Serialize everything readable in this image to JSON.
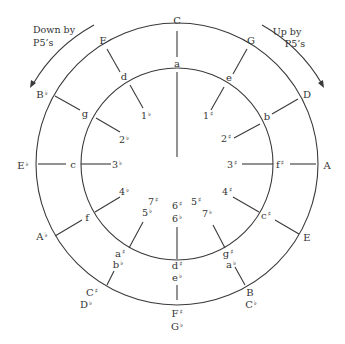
{
  "diagram": {
    "colors": {
      "line": "#3a3a3a",
      "text": "#333333",
      "background": "#ffffff"
    },
    "geometry": {
      "cx": 177,
      "cy": 164,
      "outer_r": 141,
      "inner_r": 96
    },
    "captions": {
      "left": {
        "line1": "Down by",
        "line2": "P5’s",
        "direction": "counterclockwise"
      },
      "right": {
        "line1": "Up by",
        "line2": "P5’s",
        "direction": "clockwise"
      }
    },
    "positions": [
      {
        "angle": 0,
        "major": [
          "C"
        ],
        "minor": [
          "a"
        ],
        "signature": [
          "0"
        ]
      },
      {
        "angle": 30,
        "major": [
          "G"
        ],
        "minor": [
          "e"
        ],
        "signature": [
          "1♯"
        ]
      },
      {
        "angle": 60,
        "major": [
          "D"
        ],
        "minor": [
          "b"
        ],
        "signature": [
          "2♯"
        ]
      },
      {
        "angle": 90,
        "major": [
          "A"
        ],
        "minor": [
          "f♯"
        ],
        "signature": [
          "3♯"
        ]
      },
      {
        "angle": 120,
        "major": [
          "E"
        ],
        "minor": [
          "c♯"
        ],
        "signature": [
          "4♯"
        ]
      },
      {
        "angle": 150,
        "major": [
          "B",
          "C♭"
        ],
        "minor": [
          "g♯",
          "a♭"
        ],
        "signature": [
          "5♯",
          "7♭"
        ]
      },
      {
        "angle": 180,
        "major": [
          "F♯",
          "G♭"
        ],
        "minor": [
          "d♯",
          "e♭"
        ],
        "signature": [
          "6♯",
          "6♭"
        ]
      },
      {
        "angle": 210,
        "major": [
          "C♯",
          "D♭"
        ],
        "minor": [
          "a♯",
          "b♭"
        ],
        "signature": [
          "7♯",
          "5♭"
        ]
      },
      {
        "angle": 240,
        "major": [
          "A♭"
        ],
        "minor": [
          "f"
        ],
        "signature": [
          "4♭"
        ]
      },
      {
        "angle": 270,
        "major": [
          "E♭"
        ],
        "minor": [
          "c"
        ],
        "signature": [
          "3♭"
        ]
      },
      {
        "angle": 300,
        "major": [
          "B♭"
        ],
        "minor": [
          "g"
        ],
        "signature": [
          "2♭"
        ]
      },
      {
        "angle": 330,
        "major": [
          "F"
        ],
        "minor": [
          "d"
        ],
        "signature": [
          "1♭"
        ]
      }
    ],
    "labels": {
      "major": {
        "C": {
          "text": "C",
          "acc": "",
          "x": 177,
          "y": 24
        },
        "G": {
          "text": "G",
          "acc": "",
          "x": 251,
          "y": 44
        },
        "D": {
          "text": "D",
          "acc": "",
          "x": 307,
          "y": 98
        },
        "A": {
          "text": "A",
          "acc": "",
          "x": 327,
          "y": 169
        },
        "E": {
          "text": "E",
          "acc": "",
          "x": 307,
          "y": 241
        },
        "B": {
          "text": "B",
          "acc": "",
          "x": 250,
          "y": 296
        },
        "Cb": {
          "text": "C",
          "acc": "♭",
          "x": 251,
          "y": 308
        },
        "Fs": {
          "text": "F",
          "acc": "♯",
          "x": 177,
          "y": 317
        },
        "Gb": {
          "text": "G",
          "acc": "♭",
          "x": 177,
          "y": 330
        },
        "Cs": {
          "text": "C",
          "acc": "♯",
          "x": 92,
          "y": 296
        },
        "Db": {
          "text": "D",
          "acc": "♭",
          "x": 86,
          "y": 308
        },
        "Ab": {
          "text": "A",
          "acc": "♭",
          "x": 42,
          "y": 240
        },
        "Eb": {
          "text": "E",
          "acc": "♭",
          "x": 23,
          "y": 169
        },
        "Bb": {
          "text": "B",
          "acc": "♭",
          "x": 42,
          "y": 98
        },
        "F": {
          "text": "F",
          "acc": "",
          "x": 103,
          "y": 44
        }
      },
      "minor": {
        "a": {
          "text": "a",
          "acc": "",
          "x": 177,
          "y": 67
        },
        "e": {
          "text": "e",
          "acc": "",
          "x": 229,
          "y": 81
        },
        "b": {
          "text": "b",
          "acc": "",
          "x": 267,
          "y": 120
        },
        "fs": {
          "text": "f",
          "acc": "♯",
          "x": 280,
          "y": 168
        },
        "cs": {
          "text": "c",
          "acc": "♯",
          "x": 266,
          "y": 219
        },
        "gs": {
          "text": "g",
          "acc": "♯",
          "x": 228,
          "y": 257
        },
        "ab": {
          "text": "a",
          "acc": "♭",
          "x": 231,
          "y": 268
        },
        "ds": {
          "text": "d",
          "acc": "♯",
          "x": 177,
          "y": 269
        },
        "eb": {
          "text": "e",
          "acc": "♭",
          "x": 177,
          "y": 281
        },
        "as": {
          "text": "a",
          "acc": "♯",
          "x": 120,
          "y": 257
        },
        "bb": {
          "text": "b",
          "acc": "♭",
          "x": 118,
          "y": 268
        },
        "f": {
          "text": "f",
          "acc": "",
          "x": 87,
          "y": 221
        },
        "c": {
          "text": "c",
          "acc": "",
          "x": 73,
          "y": 168
        },
        "g": {
          "text": "g",
          "acc": "",
          "x": 85,
          "y": 117
        },
        "d": {
          "text": "d",
          "acc": "",
          "x": 124,
          "y": 80
        }
      },
      "signature": {
        "1s": {
          "text": "1",
          "acc": "♯",
          "x": 208,
          "y": 119
        },
        "2s": {
          "text": "2",
          "acc": "♯",
          "x": 226,
          "y": 142
        },
        "3s": {
          "text": "3",
          "acc": "♯",
          "x": 232,
          "y": 168
        },
        "4s": {
          "text": "4",
          "acc": "♯",
          "x": 227,
          "y": 195
        },
        "5s": {
          "text": "5",
          "acc": "♯",
          "x": 196,
          "y": 205
        },
        "7b": {
          "text": "7",
          "acc": "♭",
          "x": 207,
          "y": 217
        },
        "6s": {
          "text": "6",
          "acc": "♯",
          "x": 177,
          "y": 209
        },
        "6b": {
          "text": "6",
          "acc": "♭",
          "x": 177,
          "y": 222
        },
        "7s": {
          "text": "7",
          "acc": "♯",
          "x": 153,
          "y": 205
        },
        "5b": {
          "text": "5",
          "acc": "♭",
          "x": 147,
          "y": 216
        },
        "4b": {
          "text": "4",
          "acc": "♭",
          "x": 124,
          "y": 195
        },
        "3b": {
          "text": "3",
          "acc": "♭",
          "x": 117,
          "y": 168
        },
        "2b": {
          "text": "2",
          "acc": "♭",
          "x": 124,
          "y": 143
        },
        "1b": {
          "text": "1",
          "acc": "♭",
          "x": 146,
          "y": 119
        }
      }
    }
  }
}
